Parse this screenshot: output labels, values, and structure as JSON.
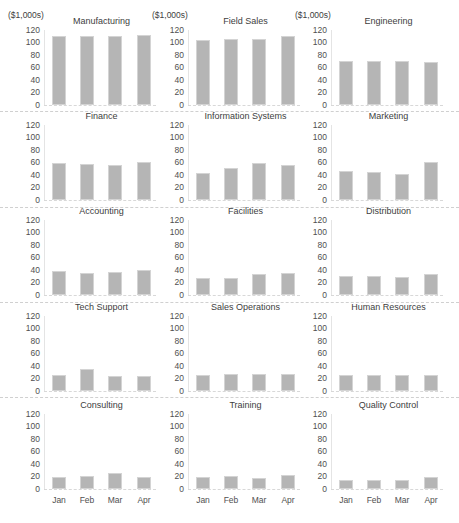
{
  "chart_data": {
    "type": "bar",
    "layout": "small-multiples 5x3",
    "unit_label": "($1,000s)",
    "categories": [
      "Jan",
      "Feb",
      "Mar",
      "Apr"
    ],
    "yticks": [
      "120",
      "100",
      "80",
      "60",
      "40",
      "20",
      "0"
    ],
    "ylim": [
      0,
      120
    ],
    "grid": false,
    "legend": "none",
    "bar_color": "#b5b5b5",
    "panels": [
      {
        "title": "Manufacturing",
        "values": [
          110,
          111,
          110,
          112
        ]
      },
      {
        "title": "Field Sales",
        "values": [
          104,
          106,
          105,
          110
        ]
      },
      {
        "title": "Engineering",
        "values": [
          70,
          71,
          70,
          69
        ]
      },
      {
        "title": "Finance",
        "values": [
          59,
          57,
          56,
          61
        ]
      },
      {
        "title": "Information Systems",
        "values": [
          44,
          51,
          60,
          56
        ]
      },
      {
        "title": "Marketing",
        "values": [
          46,
          45,
          41,
          61
        ]
      },
      {
        "title": "Accounting",
        "values": [
          38,
          36,
          37,
          40
        ]
      },
      {
        "title": "Facilities",
        "values": [
          27,
          28,
          33,
          35
        ]
      },
      {
        "title": "Distribution",
        "values": [
          31,
          30,
          29,
          34
        ]
      },
      {
        "title": "Tech Support",
        "values": [
          25,
          35,
          24,
          24
        ]
      },
      {
        "title": "Sales Operations",
        "values": [
          26,
          27,
          27,
          28
        ]
      },
      {
        "title": "Human Resources",
        "values": [
          25,
          25,
          25,
          26
        ]
      },
      {
        "title": "Consulting",
        "values": [
          20,
          21,
          25,
          20
        ]
      },
      {
        "title": "Training",
        "values": [
          20,
          21,
          17,
          22
        ]
      },
      {
        "title": "Quality Control",
        "values": [
          15,
          15,
          14,
          19
        ]
      }
    ]
  }
}
